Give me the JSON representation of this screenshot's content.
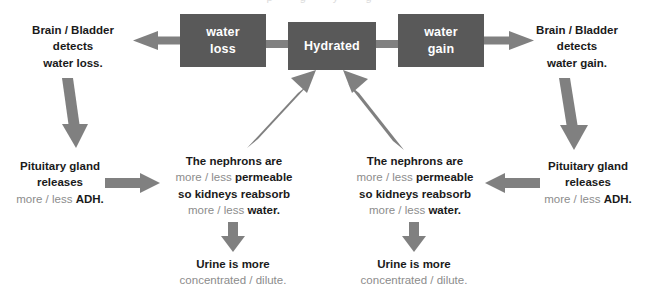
{
  "diagram": {
    "title_cropped": "p g y g",
    "colors": {
      "box_fill": "#595959",
      "box_text": "#ffffff",
      "arrow": "#808080",
      "text_strong": "#1a1a1a",
      "text_soft": "#8c8c8c",
      "background": "#ffffff"
    },
    "boxes": [
      {
        "id": "water-loss",
        "line1": "water",
        "line2": "loss"
      },
      {
        "id": "hydrated",
        "line1": "Hydrated",
        "line2": ""
      },
      {
        "id": "water-gain",
        "line1": "water",
        "line2": "gain"
      }
    ],
    "labels": {
      "brain_left": {
        "line1": "Brain / Bladder",
        "line2": "detects",
        "line3": "water loss."
      },
      "brain_right": {
        "line1": "Brain / Bladder",
        "line2": "detects",
        "line3": "water gain."
      },
      "pituitary_left": {
        "line1": "Pituitary gland",
        "line2": "releases",
        "line3_soft": "more / less ",
        "line3_strong": "ADH."
      },
      "pituitary_right": {
        "line1": "Pituitary gland",
        "line2": "releases",
        "line3_soft": "more / less ",
        "line3_strong": "ADH."
      },
      "nephrons_left": {
        "line1": "The nephrons are",
        "line2_soft": "more / less ",
        "line2_strong": "permeable",
        "line3": "so kidneys reabsorb",
        "line4_soft": "more / less ",
        "line4_strong": "water."
      },
      "nephrons_right": {
        "line1": "The nephrons are",
        "line2_soft": "more / less ",
        "line2_strong": "permeable",
        "line3": "so kidneys reabsorb",
        "line4_soft": "more / less ",
        "line4_strong": "water."
      },
      "urine_left": {
        "line1": "Urine is more",
        "line2_soft": "concentrated / dilute."
      },
      "urine_right": {
        "line1": "Urine is more",
        "line2_soft": "concentrated / dilute."
      }
    },
    "arrows": [
      {
        "id": "water-loss-to-brain-left",
        "direction": "left"
      },
      {
        "id": "hydrated-to-water-loss",
        "direction": "left"
      },
      {
        "id": "hydrated-to-water-gain",
        "direction": "right"
      },
      {
        "id": "water-gain-to-brain-right",
        "direction": "right"
      },
      {
        "id": "brain-left-to-pituitary-left",
        "direction": "down"
      },
      {
        "id": "brain-right-to-pituitary-right",
        "direction": "down"
      },
      {
        "id": "pituitary-left-to-nephrons-left",
        "direction": "right"
      },
      {
        "id": "pituitary-right-to-nephrons-right",
        "direction": "left"
      },
      {
        "id": "nephrons-left-to-urine-left",
        "direction": "down"
      },
      {
        "id": "nephrons-right-to-urine-right",
        "direction": "down"
      },
      {
        "id": "urine-left-to-hydrated",
        "direction": "up-right"
      },
      {
        "id": "urine-right-to-hydrated",
        "direction": "up-left"
      }
    ]
  }
}
